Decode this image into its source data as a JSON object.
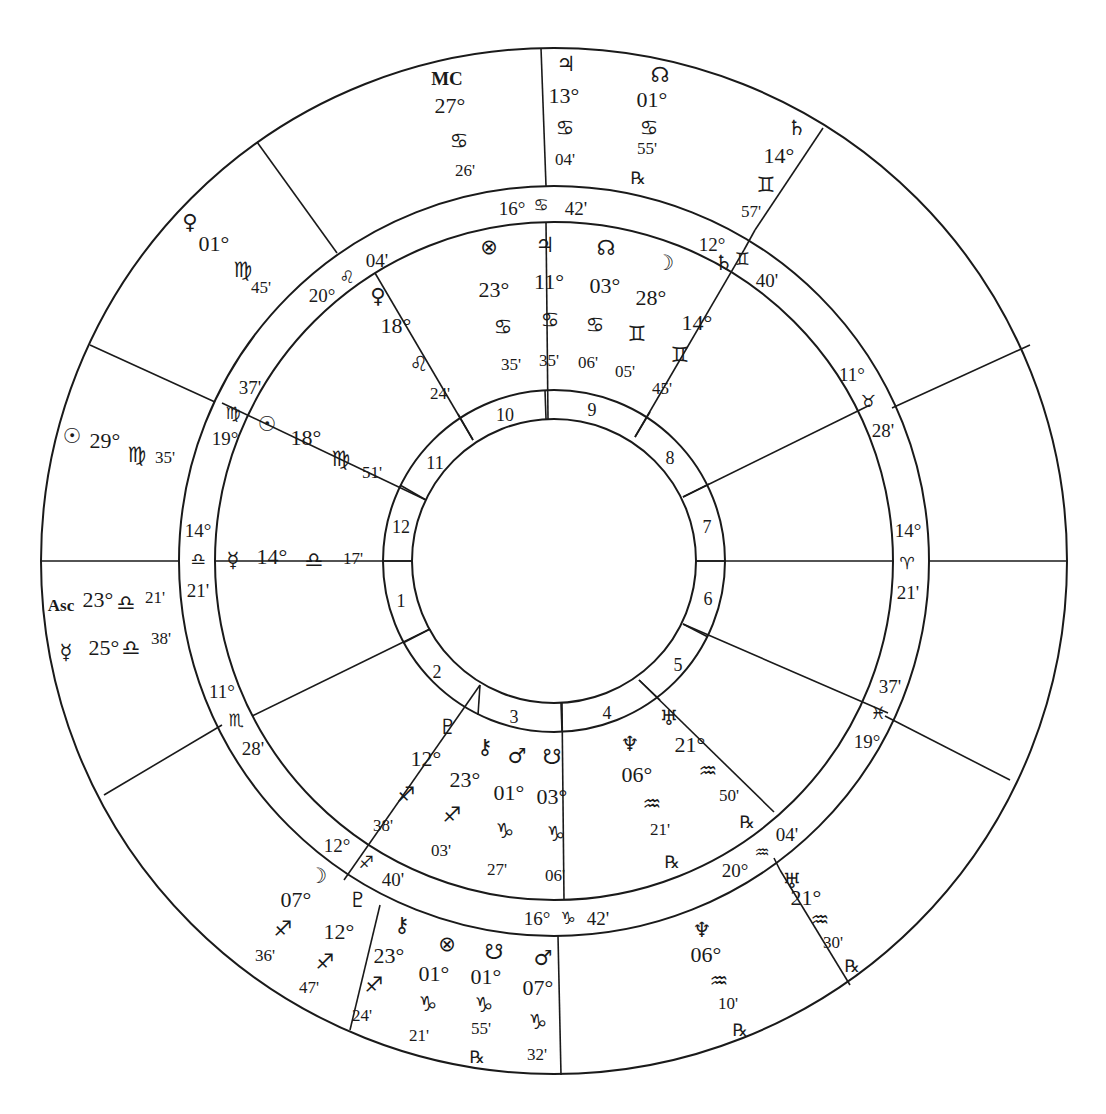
{
  "chart": {
    "title": "",
    "type": "astrological bi-wheel",
    "colors": {
      "ink": "#1a1a1a",
      "paper": "#ffffff"
    },
    "geometry": {
      "cx": 554,
      "cy": 561,
      "r_outer": 513,
      "r_band_outer": 375,
      "r_band_inner": 339,
      "r_house_outer": 171,
      "r_house_inner": 142
    }
  },
  "glyphs": {
    "sun": "☉",
    "moon": "☽",
    "mercury": "☿",
    "venus": "♀",
    "mars": "♂",
    "jupiter": "♃",
    "saturn": "♄",
    "uranus": "♅",
    "neptune": "♆",
    "pluto": "♇",
    "chiron": "⚷",
    "north_node": "☊",
    "south_node": "☋",
    "part_of_fortune": "⊗",
    "aries": "♈",
    "taurus": "♉",
    "gemini": "♊",
    "cancer": "♋",
    "leo": "♌",
    "virgo": "♍",
    "libra": "♎",
    "scorpio": "♏",
    "sagittarius": "♐",
    "capricorn": "♑",
    "aquarius": "♒",
    "pisces": "♓",
    "retrograde": "℞"
  },
  "house_numbers": [
    "1",
    "2",
    "3",
    "4",
    "5",
    "6",
    "7",
    "8",
    "9",
    "10",
    "11",
    "12"
  ],
  "cusps": [
    {
      "id": "cusp-mc",
      "deg": "16°",
      "sign": "♋",
      "min": "42'"
    },
    {
      "id": "cusp-11",
      "deg": "20°",
      "sign": "♌",
      "min": "04'"
    },
    {
      "id": "cusp-12",
      "deg": "19°",
      "sign": "♍",
      "min": "37'"
    },
    {
      "id": "cusp-asc",
      "deg": "14°",
      "sign": "♎",
      "min": "21'"
    },
    {
      "id": "cusp-2",
      "deg": "11°",
      "sign": "♏",
      "min": "28'"
    },
    {
      "id": "cusp-3",
      "deg": "12°",
      "sign": "♐",
      "min": "40'"
    },
    {
      "id": "cusp-ic",
      "deg": "16°",
      "sign": "♑",
      "min": "42'"
    },
    {
      "id": "cusp-5",
      "deg": "20°",
      "sign": "♒",
      "min": "04'"
    },
    {
      "id": "cusp-6",
      "deg": "19°",
      "sign": "♓",
      "min": "37'"
    },
    {
      "id": "cusp-dsc",
      "deg": "14°",
      "sign": "♈",
      "min": "21'"
    },
    {
      "id": "cusp-8",
      "deg": "11°",
      "sign": "♉",
      "min": "28'"
    },
    {
      "id": "cusp-9",
      "deg": "12°",
      "sign": "♊",
      "min": "40'"
    }
  ],
  "inner_planets": [
    {
      "name": "part-of-fortune",
      "glyph": "⊗",
      "deg": "23°",
      "sign": "♋",
      "min": "35'",
      "retro": ""
    },
    {
      "name": "jupiter",
      "glyph": "♃",
      "deg": "11°",
      "sign": "♋",
      "min": "35'",
      "retro": ""
    },
    {
      "name": "north-node",
      "glyph": "☊",
      "deg": "03°",
      "sign": "♋",
      "min": "06'",
      "retro": ""
    },
    {
      "name": "moon",
      "glyph": "☽",
      "deg": "28°",
      "sign": "♊",
      "min": "05'",
      "retro": ""
    },
    {
      "name": "saturn",
      "glyph": "♄",
      "deg": "14°",
      "sign": "♊",
      "min": "45'",
      "retro": ""
    },
    {
      "name": "venus",
      "glyph": "♀",
      "deg": "18°",
      "sign": "♌",
      "min": "24'",
      "retro": ""
    },
    {
      "name": "sun",
      "glyph": "☉",
      "deg": "18°",
      "sign": "♍",
      "min": "51'",
      "retro": ""
    },
    {
      "name": "mercury",
      "glyph": "☿",
      "deg": "14°",
      "sign": "♎",
      "min": "17'",
      "retro": ""
    },
    {
      "name": "pluto",
      "glyph": "♇",
      "deg": "12°",
      "sign": "♐",
      "min": "38'",
      "retro": ""
    },
    {
      "name": "chiron",
      "glyph": "⚷",
      "deg": "23°",
      "sign": "♐",
      "min": "03'",
      "retro": ""
    },
    {
      "name": "mars",
      "glyph": "♂",
      "deg": "01°",
      "sign": "♑",
      "min": "27'",
      "retro": ""
    },
    {
      "name": "south-node",
      "glyph": "☋",
      "deg": "03°",
      "sign": "♑",
      "min": "06'",
      "retro": ""
    },
    {
      "name": "neptune",
      "glyph": "♆",
      "deg": "06°",
      "sign": "♒",
      "min": "21'",
      "retro": "℞"
    },
    {
      "name": "uranus",
      "glyph": "♅",
      "deg": "21°",
      "sign": "♒",
      "min": "50'",
      "retro": "℞"
    }
  ],
  "outer_planets": [
    {
      "name": "mc",
      "glyph": "MC",
      "deg": "27°",
      "sign": "♋",
      "min": "26'",
      "retro": ""
    },
    {
      "name": "jupiter",
      "glyph": "♃",
      "deg": "13°",
      "sign": "♋",
      "min": "04'",
      "retro": ""
    },
    {
      "name": "north-node",
      "glyph": "☊",
      "deg": "01°",
      "sign": "♋",
      "min": "55'",
      "retro": "℞"
    },
    {
      "name": "saturn",
      "glyph": "♄",
      "deg": "14°",
      "sign": "♊",
      "min": "57'",
      "retro": ""
    },
    {
      "name": "venus",
      "glyph": "♀",
      "deg": "01°",
      "sign": "♍",
      "min": "45'",
      "retro": ""
    },
    {
      "name": "sun",
      "glyph": "☉",
      "deg": "29°",
      "sign": "♍",
      "min": "35'",
      "retro": ""
    },
    {
      "name": "ascendant",
      "glyph": "Asc",
      "deg": "23°",
      "sign": "♎",
      "min": "21'",
      "retro": ""
    },
    {
      "name": "mercury",
      "glyph": "☿",
      "deg": "25°",
      "sign": "♎",
      "min": "38'",
      "retro": ""
    },
    {
      "name": "moon",
      "glyph": "☽",
      "deg": "07°",
      "sign": "♐",
      "min": "36'",
      "retro": ""
    },
    {
      "name": "pluto",
      "glyph": "♇",
      "deg": "12°",
      "sign": "♐",
      "min": "47'",
      "retro": ""
    },
    {
      "name": "chiron",
      "glyph": "⚷",
      "deg": "23°",
      "sign": "♐",
      "min": "24'",
      "retro": ""
    },
    {
      "name": "part-of-fortune",
      "glyph": "⊗",
      "deg": "01°",
      "sign": "♑",
      "min": "21'",
      "retro": ""
    },
    {
      "name": "south-node",
      "glyph": "☋",
      "deg": "01°",
      "sign": "♑",
      "min": "55'",
      "retro": "℞"
    },
    {
      "name": "mars",
      "glyph": "♂",
      "deg": "07°",
      "sign": "♑",
      "min": "32'",
      "retro": ""
    },
    {
      "name": "neptune",
      "glyph": "♆",
      "deg": "06°",
      "sign": "♒",
      "min": "10'",
      "retro": "℞"
    },
    {
      "name": "uranus",
      "glyph": "♅",
      "deg": "21°",
      "sign": "♒",
      "min": "30'",
      "retro": "℞"
    }
  ]
}
